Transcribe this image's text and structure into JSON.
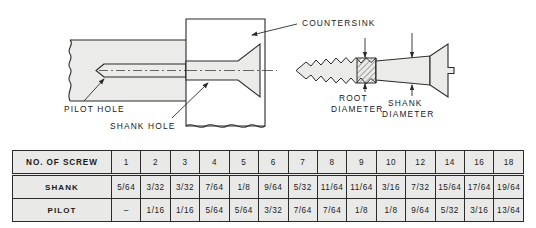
{
  "figure": {
    "labels": {
      "countersink": "COUNTERSINK",
      "pilot_hole": "PILOT HOLE",
      "shank_hole": "SHANK HOLE",
      "root_diameter_line1": "ROOT",
      "root_diameter_line2": "DIAMETER",
      "shank_diameter_line1": "SHANK",
      "shank_diameter_line2": "DIAMETER"
    },
    "colors": {
      "line": "#2b2b2b",
      "fill": "#ebebe9",
      "table_background": "#e9e9e7",
      "page_background": "#ffffff"
    }
  },
  "table": {
    "row_headers": [
      "NO. OF SCREW",
      "SHANK",
      "PILOT"
    ],
    "screw_numbers": [
      "1",
      "2",
      "3",
      "4",
      "5",
      "6",
      "7",
      "8",
      "9",
      "10",
      "12",
      "14",
      "16",
      "18"
    ],
    "shank": [
      "5/64",
      "3/32",
      "3/32",
      "7/64",
      "1/8",
      "9/64",
      "5/32",
      "11/64",
      "11/64",
      "3/16",
      "7/32",
      "15/64",
      "17/64",
      "19/64"
    ],
    "pilot": [
      "–",
      "1/16",
      "1/16",
      "5/64",
      "5/64",
      "3/32",
      "7/64",
      "7/64",
      "1/8",
      "1/8",
      "9/64",
      "5/32",
      "3/16",
      "13/64"
    ]
  }
}
